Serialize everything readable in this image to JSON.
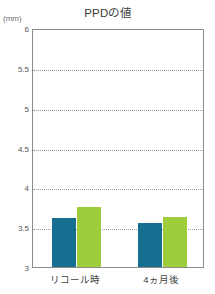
{
  "chart_data": {
    "type": "bar",
    "title": "PPDの値",
    "unit_label": "(mm)",
    "xlabel": "",
    "ylabel": "",
    "ylim": [
      3,
      6
    ],
    "ytick_step": 0.5,
    "ytick_labels": [
      "6",
      "5.5",
      "5",
      "4.5",
      "4",
      "3.5",
      "3"
    ],
    "ytick_values": [
      6,
      5.5,
      5,
      4.5,
      4,
      3.5,
      3
    ],
    "gridlines": [
      5.5,
      5,
      4.5,
      4,
      3.5
    ],
    "grid": true,
    "legend": "none",
    "categories": [
      "リコール時",
      "4ヵ月後"
    ],
    "series": [
      {
        "name": "series-1",
        "color": "#166e90",
        "values": [
          3.62,
          3.55
        ]
      },
      {
        "name": "series-2",
        "color": "#9fcc3b",
        "values": [
          3.75,
          3.63
        ]
      }
    ]
  },
  "colors": {
    "series_1": "#166e90",
    "series_2": "#9fcc3b",
    "frame": "#8c8c8c",
    "gridline": "#9a9a9a",
    "title_text": "#3b3b3b",
    "tick_text": "#555555",
    "background": "#ffffff"
  }
}
